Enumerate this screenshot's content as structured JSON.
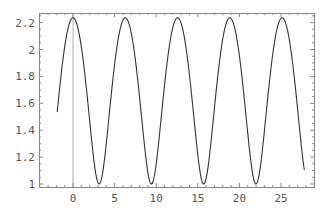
{
  "chart_data": {
    "type": "line",
    "title": "",
    "xlabel": "",
    "ylabel": "",
    "function_estimate": "sqrt(3 + 2 cos x)",
    "xlim": [
      -4.1,
      29.0
    ],
    "ylim": [
      0.98,
      2.27
    ],
    "x_ticks": [
      0,
      5,
      10,
      15,
      20,
      25
    ],
    "x_tick_labels": [
      "0",
      "5",
      "10",
      "15",
      "20",
      "25"
    ],
    "y_ticks": [
      1,
      1.2,
      1.4,
      1.6,
      1.8,
      2,
      2.2
    ],
    "y_tick_labels": [
      "1",
      "1.2",
      "1.4",
      "1.6",
      "1.8",
      "2",
      "2.2"
    ],
    "grid": false,
    "legend": null,
    "reference_line": {
      "orientation": "vertical",
      "x": 0,
      "color": "#b0b0b0"
    },
    "series": [
      {
        "name": "f(x)",
        "color": "#333333",
        "x_range": [
          -1.9,
          27.8
        ],
        "peaks": [
          [
            0,
            2.236
          ],
          [
            6.283,
            2.236
          ],
          [
            12.566,
            2.236
          ],
          [
            18.85,
            2.236
          ],
          [
            25.133,
            2.236
          ]
        ],
        "troughs": [
          [
            -3.142,
            1.0
          ],
          [
            3.142,
            1.0
          ],
          [
            9.425,
            1.0
          ],
          [
            15.708,
            1.0
          ],
          [
            21.991,
            1.0
          ]
        ],
        "x": [
          -1.9,
          -1.5,
          -1,
          0,
          1,
          2,
          3.14,
          4.28,
          5.28,
          6.28,
          7.28,
          8.28,
          9.42,
          10.57,
          11.57,
          12.57,
          13.57,
          14.57,
          15.71,
          16.85,
          17.85,
          18.85,
          19.85,
          20.85,
          21.99,
          23.13,
          24.13,
          25.13,
          26.13,
          27.13,
          27.8
        ],
        "y": [
          1.39,
          1.74,
          1.93,
          2.236,
          1.93,
          1.46,
          1.0,
          1.46,
          1.93,
          2.236,
          1.93,
          1.46,
          1.0,
          1.46,
          1.93,
          2.236,
          1.93,
          1.46,
          1.0,
          1.46,
          1.93,
          2.236,
          1.93,
          1.46,
          1.0,
          1.46,
          1.93,
          2.236,
          1.93,
          1.46,
          1.08
        ]
      }
    ]
  },
  "plot": {
    "frame": {
      "left": 39,
      "top": 13,
      "right": 314,
      "bottom": 187
    },
    "x_map": {
      "x0_px": 73,
      "px_per_unit": 8.32
    },
    "y_map": {
      "y1_px": 184,
      "px_per_unit": 134.5
    },
    "curve_sample_range": [
      -1.9,
      27.8
    ],
    "axis_color": "#888888",
    "ref_line_color": "#b0b0b0",
    "curve_color": "#333333"
  }
}
